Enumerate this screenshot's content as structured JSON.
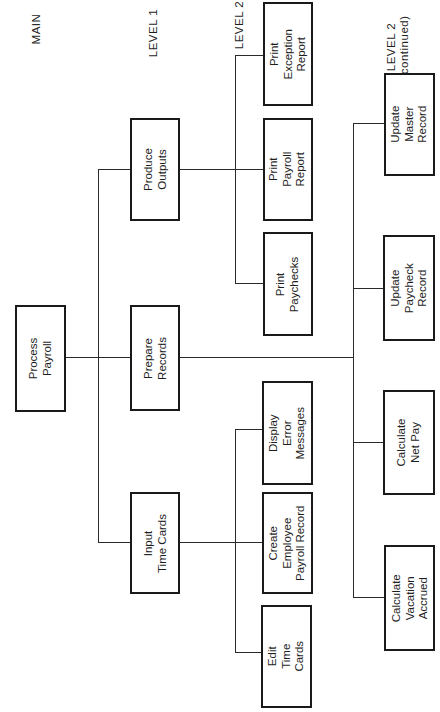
{
  "diagram": {
    "type": "hierarchy-chart",
    "orientation": "rotated-90-ccw",
    "headings": {
      "main": "MAIN",
      "level1": "LEVEL 1",
      "level2": "LEVEL 2",
      "level2_continued": "LEVEL 2\n(continued)"
    },
    "main": {
      "label": "Process\nPayroll"
    },
    "level1": [
      {
        "label": "Produce\nOutputs"
      },
      {
        "label": "Prepare\nRecords"
      },
      {
        "label": "Input\nTime Cards"
      }
    ],
    "level2_produce_outputs": [
      {
        "label": "Print\nException\nReport"
      },
      {
        "label": "Print\nPayroll\nReport"
      },
      {
        "label": "Print\nPaychecks"
      }
    ],
    "level2_input_time_cards": [
      {
        "label": "Display\nError\nMessages"
      },
      {
        "label": "Create\nEmployee\nPayroll Record"
      },
      {
        "label": "Edit\nTime\nCards"
      }
    ],
    "level2_prepare_records": [
      {
        "label": "Update\nMaster\nRecord"
      },
      {
        "label": "Update\nPaycheck\nRecord"
      },
      {
        "label": "Calculate\nNet Pay"
      },
      {
        "label": "Calculate\nVacation\nAccrued"
      }
    ],
    "colors": {
      "line": "#2a2a2a",
      "box_border": "#1a1a1a",
      "background": "#ffffff"
    }
  }
}
